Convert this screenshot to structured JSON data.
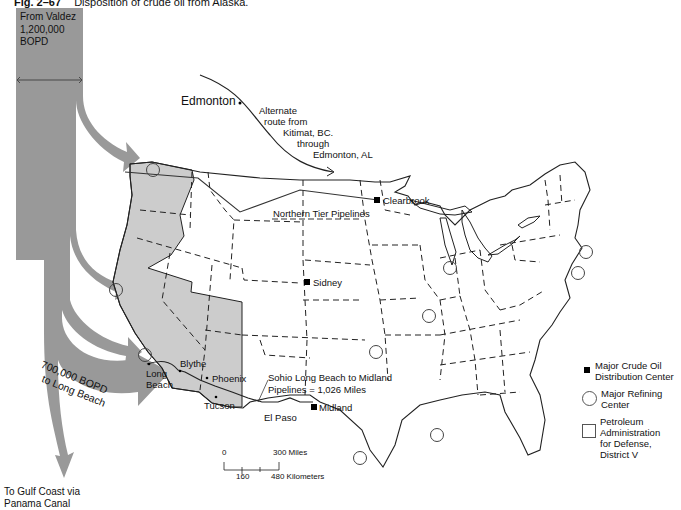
{
  "caption": {
    "figure_number": "Fig. 2–67",
    "title": "Disposition of crude oil from Alaska."
  },
  "flow": {
    "source_label": "From Valdez",
    "source_volume": "1,200,000",
    "source_unit": "BOPD",
    "long_beach_flow_line1": "700,000 BOPD",
    "long_beach_flow_line2": "to Long Beach",
    "gulf_line1": "To Gulf Coast via",
    "gulf_line2": "Panama Canal"
  },
  "alternate_route": {
    "line1": "Alternate",
    "line2": "route from",
    "line3": "Kitimat, BC.",
    "line4": "through",
    "line5": "Edmonton, AL"
  },
  "places": {
    "edmonton": "Edmonton",
    "clearbrook": "Clearbrook",
    "sidney": "Sidney",
    "midland": "Midland",
    "el_paso": "El Paso",
    "tucson": "Tucson",
    "phoenix": "Phoenix",
    "blythe": "Blythe",
    "long_beach_1": "Long",
    "long_beach_2": "Beach"
  },
  "pipelines": {
    "northern_tier": "Northern Tier Pipelines",
    "sohio_line1": "Sohio Long Beach to Midland",
    "sohio_line2": "Pipelines = 1,026 Miles"
  },
  "scale": {
    "zero": "0",
    "miles": "300 Miles",
    "km_mid": "160",
    "km": "480 Kilometers"
  },
  "legend": {
    "items": [
      {
        "symbol": "filled-square",
        "line1": "Major Crude Oil",
        "line2": "Distribution Center"
      },
      {
        "symbol": "open-circle",
        "line1": "Major Refining",
        "line2": "Center"
      },
      {
        "symbol": "open-square",
        "line1": "Petroleum",
        "line2": "Administration",
        "line3": "for Defense,",
        "line4": "District V"
      }
    ]
  },
  "colors": {
    "flow_band": "#999999",
    "district_v": "#cccccc",
    "outline": "#222222",
    "background": "#ffffff"
  }
}
